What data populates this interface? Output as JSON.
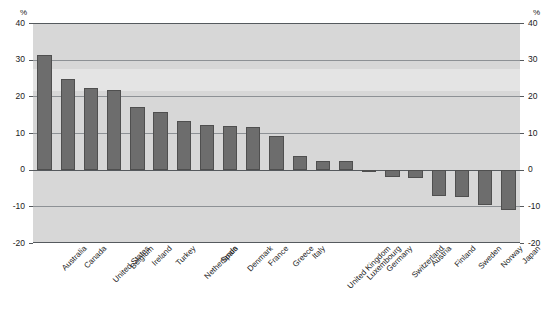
{
  "title_fragment": "",
  "axis": {
    "unit_left": "%",
    "unit_right": "%",
    "ticks": [
      40,
      30,
      20,
      10,
      0,
      -10,
      -20
    ],
    "tick_labels": [
      "40",
      "30",
      "20",
      "10",
      "0",
      "-10",
      "-20"
    ]
  },
  "chart_data": {
    "type": "bar",
    "title": "",
    "xlabel": "",
    "ylabel": "%",
    "ylim": [
      -20,
      40
    ],
    "yticks": [
      -20,
      -10,
      0,
      10,
      20,
      30,
      40
    ],
    "grid": true,
    "legend": "none",
    "orientation": "vertical",
    "categories": [
      "Australia",
      "Canada",
      "United States",
      "Belgium",
      "Ireland",
      "Turkey",
      "Netherlands",
      "Spain",
      "Denmark",
      "France",
      "Greece",
      "Italy",
      "United Kingdom",
      "Luxembourg",
      "Germany",
      "Switzerland",
      "Austria",
      "Finland",
      "Sweden",
      "Norway",
      "Japan"
    ],
    "values": [
      31.2,
      24.7,
      22.3,
      21.7,
      17.0,
      15.7,
      13.3,
      12.1,
      11.8,
      11.7,
      9.3,
      3.7,
      2.3,
      2.3,
      -0.7,
      -2.0,
      -2.3,
      -7.3,
      -7.4,
      -9.7,
      -11.0
    ],
    "series": [
      {
        "name": "value",
        "values": [
          31.2,
          24.7,
          22.3,
          21.7,
          17.0,
          15.7,
          13.3,
          12.1,
          11.8,
          11.7,
          9.3,
          3.7,
          2.3,
          2.3,
          -0.7,
          -2.0,
          -2.3,
          -7.3,
          -7.4,
          -9.7,
          -11.0
        ]
      }
    ]
  },
  "colors": {
    "bar_fill": "#6d6d6d",
    "bar_stroke": "#4f4f4f",
    "plot_background": "#d7d7d7",
    "gridline": "#8d9195",
    "axis_line": "#55595d",
    "page_background": "#ffffff"
  }
}
